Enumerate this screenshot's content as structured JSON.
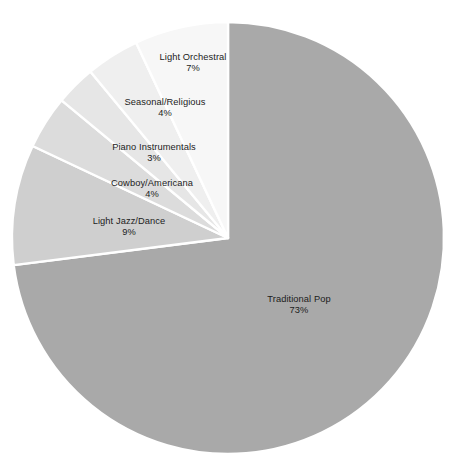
{
  "chart_data": {
    "type": "pie",
    "title": "",
    "subtitle": "",
    "xlabel": "",
    "ylabel": "",
    "legend": "none",
    "grid": false,
    "units": "percent",
    "start_angle_deg": 0,
    "direction": "clockwise",
    "categories": [
      "Traditional Pop",
      "Light Jazz/Dance",
      "Cowboy/Americana",
      "Piano Instrumentals",
      "Seasonal/Religious",
      "Light Orchestral"
    ],
    "values": [
      73,
      9,
      4,
      3,
      4,
      7
    ],
    "slices": [
      {
        "label": "Traditional Pop",
        "value": 73,
        "value_text": "73%",
        "color": "#a9a9a9",
        "label_x": 299,
        "label_y": 305
      },
      {
        "label": "Light Jazz/Dance",
        "value": 9,
        "value_text": "9%",
        "color": "#cfcfcf",
        "label_x": 129,
        "label_y": 227
      },
      {
        "label": "Cowboy/Americana",
        "value": 4,
        "value_text": "4%",
        "color": "#dcdcdc",
        "label_x": 152,
        "label_y": 189
      },
      {
        "label": "Piano Instrumentals",
        "value": 3,
        "value_text": "3%",
        "color": "#e6e6e6",
        "label_x": 154,
        "label_y": 153
      },
      {
        "label": "Seasonal/Religious",
        "value": 4,
        "value_text": "4%",
        "color": "#efefef",
        "label_x": 165,
        "label_y": 108
      },
      {
        "label": "Light Orchestral",
        "value": 7,
        "value_text": "7%",
        "color": "#f7f7f7",
        "label_x": 193,
        "label_y": 63
      }
    ],
    "geometry": {
      "center_x": 228,
      "center_y": 238,
      "radius": 216,
      "separator_color": "#ffffff",
      "separator_width": 2.4
    },
    "background": "#ffffff"
  }
}
